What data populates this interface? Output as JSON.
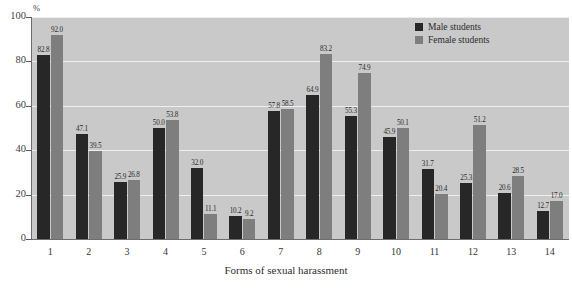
{
  "chart_data": {
    "type": "bar",
    "title": "",
    "xlabel": "Forms of sexual harassment",
    "ylabel": "%",
    "ylim": [
      0,
      100
    ],
    "yticks": [
      "0",
      "20",
      "40",
      "60",
      "80",
      "100"
    ],
    "grid": true,
    "legend_position": "top-right",
    "categories": [
      "1",
      "2",
      "3",
      "4",
      "5",
      "6",
      "7",
      "8",
      "9",
      "10",
      "11",
      "12",
      "13",
      "14"
    ],
    "series": [
      {
        "name": "Male students",
        "color": "#272727",
        "values": [
          82.8,
          47.1,
          25.9,
          50.0,
          32.0,
          10.2,
          57.8,
          64.9,
          55.3,
          45.9,
          31.7,
          25.3,
          20.6,
          12.7
        ],
        "labels": [
          "82.8",
          "47.1",
          "25.9",
          "50.0",
          "32.0",
          "10.2",
          "57.8",
          "64.9",
          "55.3",
          "45.9",
          "31.7",
          "25.3",
          "20.6",
          "12.7"
        ]
      },
      {
        "name": "Female students",
        "color": "#7e7e7e",
        "values": [
          92.0,
          39.5,
          26.8,
          53.8,
          11.1,
          9.2,
          58.5,
          83.2,
          74.9,
          50.1,
          20.4,
          51.2,
          28.5,
          17.0
        ],
        "labels": [
          "92.0",
          "39.5",
          "26.8",
          "53.8",
          "11.1",
          "9.2",
          "58.5",
          "83.2",
          "74.9",
          "50.1",
          "20.4",
          "51.2",
          "28.5",
          "17.0"
        ]
      }
    ]
  },
  "legend": {
    "items": [
      {
        "label": "Male students",
        "key": "male"
      },
      {
        "label": "Female students",
        "key": "female"
      }
    ]
  }
}
